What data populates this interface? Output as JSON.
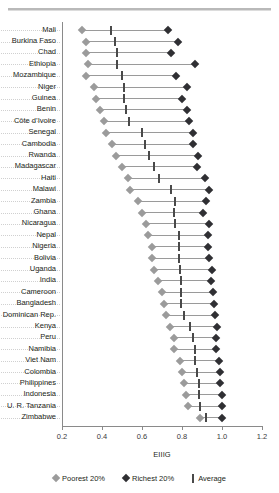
{
  "figure": {
    "top_caption_fragment": "",
    "legend": [
      {
        "key": "poorest",
        "label": "Poorest 20%",
        "marker": "diamond-light",
        "color": "#9b9b9b"
      },
      {
        "key": "richest",
        "label": "Richest 20%",
        "marker": "diamond-dark",
        "color": "#2f2f33"
      },
      {
        "key": "average",
        "label": "Average",
        "marker": "vertical-bar",
        "color": "#4a4a4a"
      }
    ]
  },
  "chart_data": {
    "type": "scatter",
    "subtype": "dumbbell-range-plot",
    "title": "",
    "xlabel": "EIIIG",
    "ylabel": "",
    "xlim": [
      0.2,
      1.2
    ],
    "xticks": [
      0.2,
      0.4,
      0.6,
      0.8,
      1.0,
      1.2
    ],
    "xticklabels": [
      "0.2",
      "0.4",
      "0.6",
      "0.8",
      "1.0",
      "1.2"
    ],
    "grid": "horizontal-dotted",
    "legend_position": "bottom",
    "orientation": "horizontal",
    "categories": [
      "Mali",
      "Burkina Faso",
      "Chad",
      "Ethiopia",
      "Mozambique",
      "Niger",
      "Guinea",
      "Benin",
      "Côte d’Ivoire",
      "Senegal",
      "Cambodia",
      "Rwanda",
      "Madagascar",
      "Haiti",
      "Malawi",
      "Zambia",
      "Ghana",
      "Nicaragua",
      "Nepal",
      "Nigeria",
      "Bolivia",
      "Uganda",
      "India",
      "Cameroon",
      "Bangladesh",
      "Dominican Rep.",
      "Kenya",
      "Peru",
      "Namibia",
      "Viet Nam",
      "Colombia",
      "Philippines",
      "Indonesia",
      "U. R. Tanzania",
      "Zimbabwe"
    ],
    "series": [
      {
        "name": "Poorest 20%",
        "key": "poorest",
        "color": "#9b9b9b",
        "values": [
          0.3,
          0.32,
          0.32,
          0.33,
          0.32,
          0.36,
          0.37,
          0.39,
          0.41,
          0.42,
          0.45,
          0.47,
          0.5,
          0.53,
          0.54,
          0.58,
          0.6,
          0.62,
          0.63,
          0.65,
          0.65,
          0.66,
          0.68,
          0.7,
          0.71,
          0.72,
          0.74,
          0.76,
          0.76,
          0.79,
          0.8,
          0.81,
          0.82,
          0.83,
          0.89
        ]
      },
      {
        "name": "Average",
        "key": "average",
        "color": "#4a4a4a",
        "values": [
          0.445,
          0.465,
          0.475,
          0.475,
          0.5,
          0.51,
          0.51,
          0.52,
          0.535,
          0.6,
          0.615,
          0.635,
          0.66,
          0.685,
          0.745,
          0.765,
          0.76,
          0.765,
          0.785,
          0.785,
          0.785,
          0.79,
          0.795,
          0.795,
          0.795,
          0.81,
          0.84,
          0.855,
          0.865,
          0.865,
          0.875,
          0.885,
          0.885,
          0.89,
          0.92
        ]
      },
      {
        "name": "Richest 20%",
        "key": "richest",
        "color": "#2f2f33",
        "values": [
          0.73,
          0.78,
          0.745,
          0.865,
          0.77,
          0.825,
          0.8,
          0.825,
          0.835,
          0.855,
          0.855,
          0.88,
          0.875,
          0.915,
          0.935,
          0.92,
          0.905,
          0.935,
          0.93,
          0.93,
          0.935,
          0.95,
          0.945,
          0.955,
          0.96,
          0.965,
          0.975,
          0.97,
          0.97,
          0.985,
          0.99,
          0.99,
          1.0,
          1.0,
          1.0
        ]
      }
    ]
  }
}
